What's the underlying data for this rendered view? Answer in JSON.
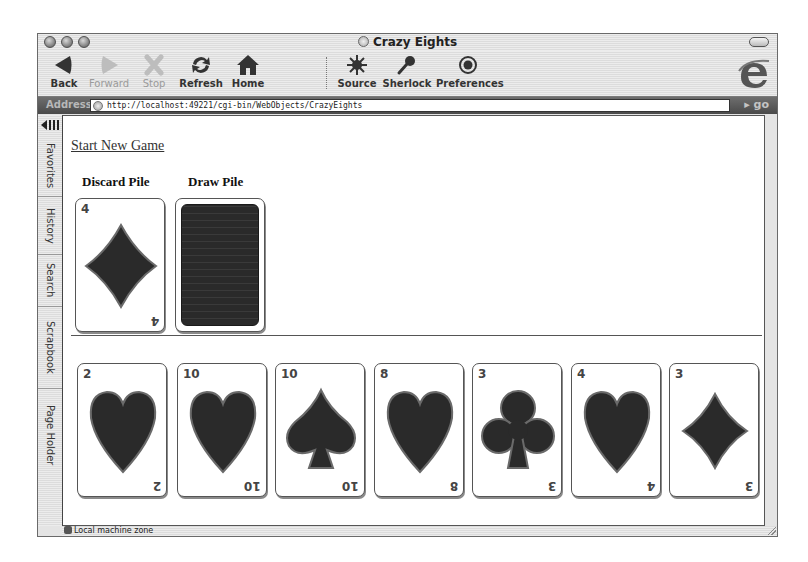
{
  "window": {
    "title": "Crazy Eights"
  },
  "toolbar": {
    "buttons": [
      {
        "label": "Back",
        "icon": "back-arrow-icon",
        "enabled": true
      },
      {
        "label": "Forward",
        "icon": "forward-arrow-icon",
        "enabled": false
      },
      {
        "label": "Stop",
        "icon": "stop-x-icon",
        "enabled": false
      },
      {
        "label": "Refresh",
        "icon": "refresh-icon",
        "enabled": true
      },
      {
        "label": "Home",
        "icon": "home-icon",
        "enabled": true
      },
      {
        "label": "Source",
        "icon": "source-starburst-icon",
        "enabled": true
      },
      {
        "label": "Sherlock",
        "icon": "sherlock-magnifier-icon",
        "enabled": true
      },
      {
        "label": "Preferences",
        "icon": "preferences-target-icon",
        "enabled": true
      }
    ]
  },
  "address_bar": {
    "label": "Address",
    "url": "http://localhost:49221/cgi-bin/WebObjects/CrazyEights",
    "go_label": "go"
  },
  "sidebar": {
    "tabs": [
      "Favorites",
      "History",
      "Search",
      "Scrapbook",
      "Page Holder"
    ]
  },
  "page": {
    "start_link": "Start New Game",
    "discard_label": "Discard Pile",
    "draw_label": "Draw Pile",
    "discard_card": {
      "rank": "4",
      "suit": "diamonds"
    },
    "hand": [
      {
        "rank": "2",
        "suit": "hearts"
      },
      {
        "rank": "10",
        "suit": "hearts"
      },
      {
        "rank": "10",
        "suit": "spades"
      },
      {
        "rank": "8",
        "suit": "hearts"
      },
      {
        "rank": "3",
        "suit": "clubs"
      },
      {
        "rank": "4",
        "suit": "hearts"
      },
      {
        "rank": "3",
        "suit": "diamonds"
      }
    ]
  },
  "status_bar": {
    "text": "Local machine zone"
  },
  "colors": {
    "suit_fill": "#2a2a2a",
    "suit_stroke": "#6a6a6a",
    "address_bg": "#5a5a5a"
  }
}
